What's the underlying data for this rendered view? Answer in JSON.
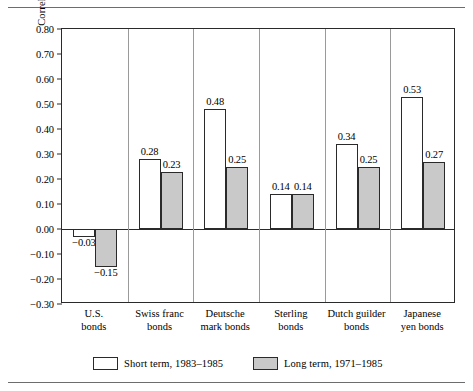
{
  "figure": {
    "y_axis_title": "Correlation coefficient"
  },
  "chart_data": {
    "type": "bar",
    "title": "",
    "xlabel": "",
    "ylabel": "Correlation coefficient",
    "ylim": [
      -0.3,
      0.8
    ],
    "ytick_labels": [
      "0.80",
      "0.70",
      "0.60",
      "0.50",
      "0.40",
      "0.30",
      "0.20",
      "0.10",
      "0.00",
      "−0.10",
      "−0.20",
      "−0.30"
    ],
    "ytick_values": [
      0.8,
      0.7,
      0.6,
      0.5,
      0.4,
      0.3,
      0.2,
      0.1,
      0.0,
      -0.1,
      -0.2,
      -0.3
    ],
    "grid": false,
    "legend_position": "bottom",
    "categories": [
      "U.S.\nbonds",
      "Swiss franc\nbonds",
      "Deutsche\nmark bonds",
      "Sterling\nbonds",
      "Dutch guilder\nbonds",
      "Japanese\nyen bonds"
    ],
    "category_lines": [
      [
        "U.S.",
        "bonds"
      ],
      [
        "Swiss franc",
        "bonds"
      ],
      [
        "Deutsche",
        "mark bonds"
      ],
      [
        "Sterling",
        "bonds"
      ],
      [
        "Dutch guilder",
        "bonds"
      ],
      [
        "Japanese",
        "yen bonds"
      ]
    ],
    "series": [
      {
        "name": "Short term, 1983–1985",
        "color": "#ffffff",
        "values": [
          -0.03,
          0.28,
          0.48,
          0.14,
          0.34,
          0.53
        ],
        "labels": [
          "−0.03",
          "0.28",
          "0.48",
          "0.14",
          "0.34",
          "0.53"
        ]
      },
      {
        "name": "Long term, 1971–1985",
        "color": "#c9c9c9",
        "values": [
          -0.15,
          0.23,
          0.25,
          0.14,
          0.25,
          0.27
        ],
        "labels": [
          "−0.15",
          "0.23",
          "0.25",
          "0.14",
          "0.25",
          "0.27"
        ]
      }
    ]
  },
  "legend": {
    "entries": [
      {
        "label": "Short term, 1983–1985",
        "swatch": "short"
      },
      {
        "label": "Long term, 1971–1985",
        "swatch": "long"
      }
    ]
  }
}
